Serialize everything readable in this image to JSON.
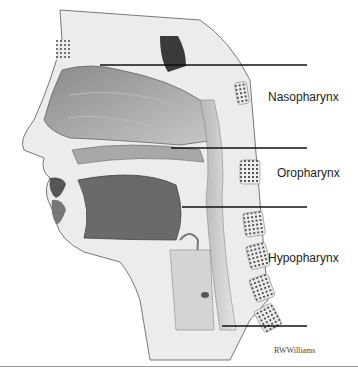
{
  "figure": {
    "labels": [
      {
        "text": "Nasopharynx",
        "x": 268,
        "y": 97
      },
      {
        "text": "Oropharynx",
        "x": 277,
        "y": 173
      },
      {
        "text": "Hypopharynx",
        "x": 268,
        "y": 258
      }
    ],
    "leader_lines": [
      {
        "x1": 100,
        "x2": 307,
        "y": 65
      },
      {
        "x1": 171,
        "x2": 307,
        "y": 148
      },
      {
        "x1": 182,
        "x2": 307,
        "y": 207
      },
      {
        "x1": 222,
        "x2": 307,
        "y": 326
      }
    ],
    "credit": "RWWilliams",
    "colors": {
      "tissue_dark": "#5a5a5a",
      "tissue_mid": "#9a9a9a",
      "tissue_light": "#d6d6d6",
      "line": "#111111"
    }
  }
}
